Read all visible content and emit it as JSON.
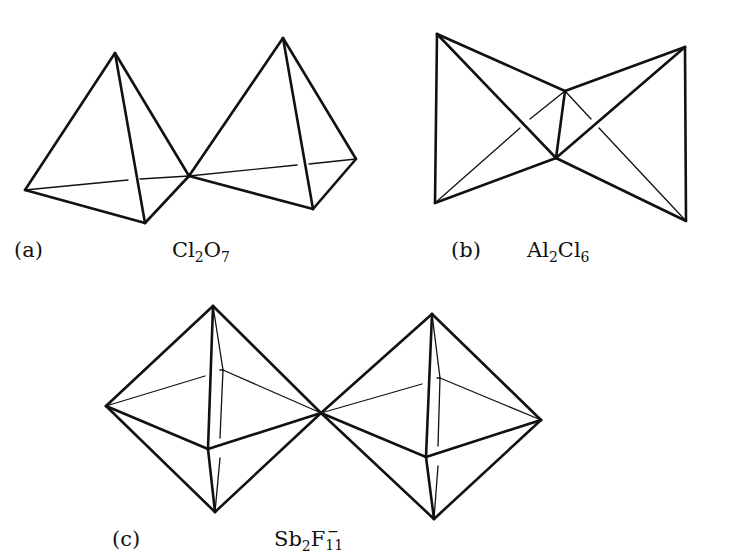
{
  "figure": {
    "panels": [
      {
        "id": "a",
        "tag": "(a)",
        "formula": {
          "parts": [
            "Cl",
            "2",
            "O",
            "7"
          ],
          "text": "Cl2O7"
        },
        "description": "Two corner-sharing tetrahedra",
        "shape": "tetrahedron",
        "count": 2,
        "shared_vertices": 1
      },
      {
        "id": "b",
        "tag": "(b)",
        "formula": {
          "parts": [
            "Al",
            "2",
            "Cl",
            "6"
          ],
          "text": "Al2Cl6"
        },
        "description": "Two edge-sharing tetrahedra",
        "shape": "tetrahedron",
        "count": 2,
        "shared_vertices": 2
      },
      {
        "id": "c",
        "tag": "(c)",
        "formula": {
          "parts": [
            "Sb",
            "2",
            "F",
            "11",
            "−"
          ],
          "text": "Sb2F11−"
        },
        "description": "Two corner-sharing octahedra",
        "shape": "octahedron",
        "count": 2,
        "shared_vertices": 1
      }
    ],
    "colors": {
      "line": "#111111",
      "background": "#ffffff"
    }
  }
}
